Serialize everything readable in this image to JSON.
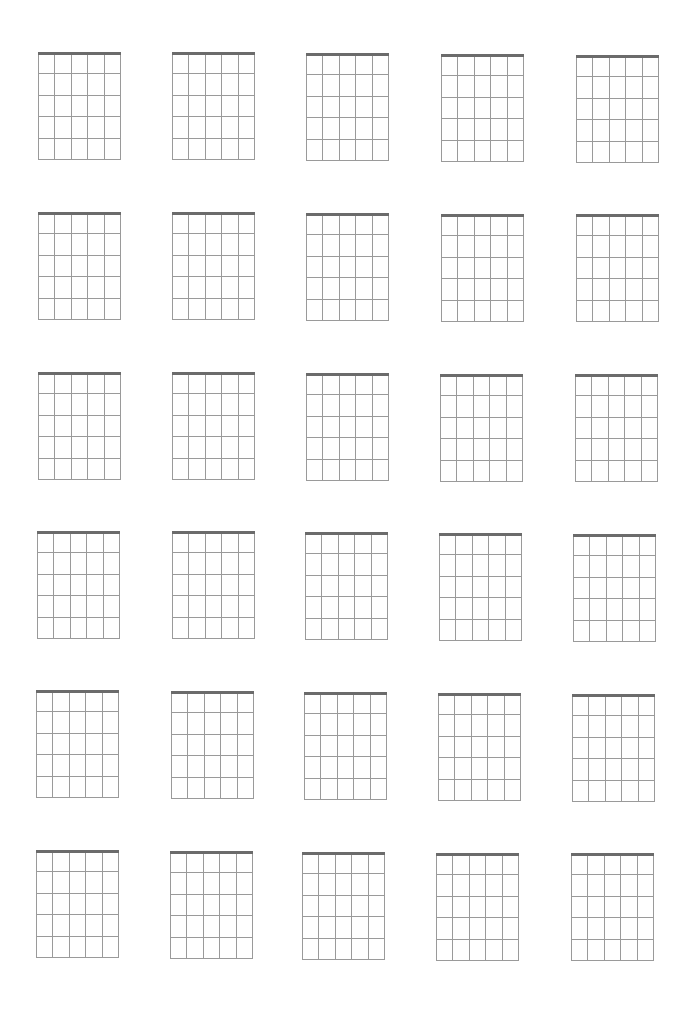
{
  "sheet": {
    "title": "",
    "rows": 6,
    "cols": 5,
    "diagram": {
      "strings": 6,
      "frets": 5,
      "width": 82,
      "height": 107,
      "nut_color": "#6b6b6b",
      "line_color": "#9a9a9a"
    },
    "boxes": [
      {
        "x": 38,
        "y": 53
      },
      {
        "x": 172,
        "y": 53
      },
      {
        "x": 306,
        "y": 54
      },
      {
        "x": 441,
        "y": 55
      },
      {
        "x": 576,
        "y": 56
      },
      {
        "x": 38,
        "y": 213
      },
      {
        "x": 172,
        "y": 213
      },
      {
        "x": 306,
        "y": 214
      },
      {
        "x": 441,
        "y": 215
      },
      {
        "x": 576,
        "y": 215
      },
      {
        "x": 38,
        "y": 373
      },
      {
        "x": 172,
        "y": 373
      },
      {
        "x": 306,
        "y": 374
      },
      {
        "x": 440,
        "y": 375
      },
      {
        "x": 575,
        "y": 375
      },
      {
        "x": 37,
        "y": 532
      },
      {
        "x": 172,
        "y": 532
      },
      {
        "x": 305,
        "y": 533
      },
      {
        "x": 439,
        "y": 534
      },
      {
        "x": 573,
        "y": 535
      },
      {
        "x": 36,
        "y": 691
      },
      {
        "x": 171,
        "y": 692
      },
      {
        "x": 304,
        "y": 693
      },
      {
        "x": 438,
        "y": 694
      },
      {
        "x": 572,
        "y": 695
      },
      {
        "x": 36,
        "y": 851
      },
      {
        "x": 170,
        "y": 852
      },
      {
        "x": 302,
        "y": 853
      },
      {
        "x": 436,
        "y": 854
      },
      {
        "x": 571,
        "y": 854
      }
    ]
  }
}
